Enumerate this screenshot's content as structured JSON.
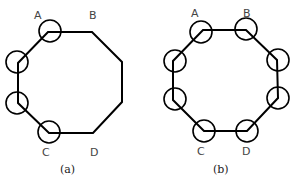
{
  "figures": [
    {
      "id": "a",
      "caption": "(a)",
      "labels": {
        "A": "A",
        "B": "B",
        "C": "C",
        "D": "D"
      },
      "vertices": [
        [
          48,
          32
        ],
        [
          92,
          32
        ],
        [
          122,
          62
        ],
        [
          122,
          102
        ],
        [
          93,
          133
        ],
        [
          49,
          133
        ],
        [
          18,
          103
        ],
        [
          18,
          63
        ]
      ],
      "circled_vertices": [
        "A",
        "left-top",
        "left-bottom",
        "C"
      ]
    },
    {
      "id": "b",
      "caption": "(b)",
      "labels": {
        "A": "A",
        "B": "B",
        "C": "C",
        "D": "D"
      },
      "vertices": [
        [
          203,
          30
        ],
        [
          246,
          30
        ],
        [
          277,
          60
        ],
        [
          278,
          98
        ],
        [
          247,
          131
        ],
        [
          204,
          131
        ],
        [
          173,
          100
        ],
        [
          173,
          61
        ]
      ],
      "circled_vertices": [
        "A",
        "B",
        "right-top",
        "right-bottom",
        "D",
        "C",
        "left-bottom",
        "left-top"
      ]
    }
  ]
}
